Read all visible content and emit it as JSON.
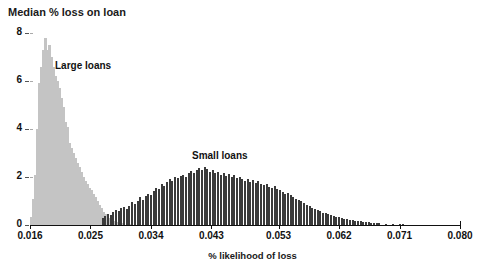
{
  "chart_data": {
    "type": "bar",
    "title": "",
    "ylabel": "Median % loss on loan",
    "xlabel": "% likelihood of loss",
    "ylim": [
      0,
      8
    ],
    "xlim": [
      0.016,
      0.08
    ],
    "grid": false,
    "legend_position": "inline-annotations",
    "y_ticks": [
      0,
      2,
      4,
      6,
      8
    ],
    "y_tick_labels": [
      "0",
      "2",
      "4",
      "6",
      "8"
    ],
    "x_ticks": [
      0.016,
      0.025,
      0.034,
      0.043,
      0.053,
      0.062,
      0.071,
      0.08
    ],
    "x_tick_labels": [
      "0.016",
      "0.025",
      "0.034",
      "0.043",
      "0.053",
      "0.062",
      "0.071",
      "0.080"
    ],
    "annotations": [
      {
        "text": "Large loans",
        "x": 0.0235,
        "y": 6.9
      },
      {
        "text": "Small loans",
        "x": 0.0395,
        "y": 3.1
      }
    ],
    "colors": {
      "large_loans": "#c4c4c4",
      "small_loans": "#3a3a3a",
      "axis": "#111111",
      "text": "#111111",
      "background": "#ffffff"
    },
    "series": [
      {
        "name": "Large loans",
        "color": "#c4c4c4",
        "x": [
          0.0162,
          0.0165,
          0.0168,
          0.0171,
          0.0174,
          0.0177,
          0.018,
          0.0183,
          0.0186,
          0.0189,
          0.0192,
          0.0195,
          0.0198,
          0.0201,
          0.0204,
          0.0207,
          0.021,
          0.0213,
          0.0216,
          0.0219,
          0.0222,
          0.0225,
          0.0228,
          0.0231,
          0.0234,
          0.0237,
          0.024,
          0.0243,
          0.0246,
          0.0249,
          0.0252,
          0.0255,
          0.0258,
          0.0261,
          0.0264,
          0.0267,
          0.027,
          0.0273,
          0.0276,
          0.0279,
          0.0282,
          0.0285,
          0.0288,
          0.0291,
          0.0294,
          0.0297,
          0.03,
          0.0305,
          0.031
        ],
        "values": [
          0.35,
          1.1,
          2.1,
          4.0,
          5.9,
          6.6,
          7.3,
          7.8,
          7.3,
          7.5,
          7.0,
          6.6,
          6.2,
          6.0,
          5.7,
          5.3,
          4.9,
          4.3,
          4.1,
          3.4,
          3.2,
          3.0,
          2.8,
          2.6,
          2.4,
          2.2,
          2.0,
          1.85,
          1.7,
          1.55,
          1.45,
          1.3,
          1.15,
          1.0,
          0.85,
          0.7,
          0.55,
          0.45,
          0.35,
          0.28,
          0.22,
          0.18,
          0.15,
          0.12,
          0.1,
          0.09,
          0.08,
          0.06,
          0.05
        ]
      },
      {
        "name": "Small loans",
        "color": "#3a3a3a",
        "x": [
          0.0268,
          0.0272,
          0.0276,
          0.028,
          0.0284,
          0.0288,
          0.0292,
          0.0296,
          0.03,
          0.0304,
          0.0308,
          0.0312,
          0.0316,
          0.032,
          0.0324,
          0.0328,
          0.0332,
          0.0336,
          0.034,
          0.0344,
          0.0348,
          0.0352,
          0.0356,
          0.036,
          0.0364,
          0.0368,
          0.0372,
          0.0376,
          0.038,
          0.0384,
          0.0388,
          0.0392,
          0.0396,
          0.04,
          0.0404,
          0.0408,
          0.0412,
          0.0416,
          0.042,
          0.0424,
          0.0428,
          0.0432,
          0.0436,
          0.044,
          0.0444,
          0.0448,
          0.0452,
          0.0456,
          0.046,
          0.0464,
          0.0468,
          0.0472,
          0.0476,
          0.048,
          0.0484,
          0.0488,
          0.0492,
          0.0496,
          0.05,
          0.0504,
          0.0508,
          0.0512,
          0.0516,
          0.052,
          0.0524,
          0.0528,
          0.0532,
          0.0536,
          0.054,
          0.0544,
          0.0548,
          0.0552,
          0.0556,
          0.056,
          0.0564,
          0.0568,
          0.0572,
          0.0576,
          0.058,
          0.0584,
          0.0588,
          0.0592,
          0.0596,
          0.06,
          0.0604,
          0.0608,
          0.0612,
          0.0616,
          0.062,
          0.0624,
          0.0628,
          0.0632,
          0.0636,
          0.064,
          0.0644,
          0.0648,
          0.0652,
          0.0656,
          0.066,
          0.0664,
          0.0668,
          0.0672,
          0.0676,
          0.068,
          0.069,
          0.07,
          0.071,
          0.0715
        ],
        "values": [
          0.3,
          0.38,
          0.45,
          0.4,
          0.55,
          0.62,
          0.58,
          0.7,
          0.75,
          0.68,
          0.8,
          0.95,
          0.88,
          1.0,
          1.15,
          1.05,
          1.2,
          1.3,
          1.25,
          1.4,
          1.55,
          1.48,
          1.7,
          1.62,
          1.8,
          1.92,
          1.85,
          2.0,
          1.95,
          2.05,
          2.1,
          2.02,
          2.18,
          2.25,
          2.15,
          2.3,
          2.38,
          2.28,
          2.4,
          2.32,
          2.2,
          2.28,
          2.15,
          2.22,
          2.1,
          2.18,
          2.05,
          2.12,
          2.0,
          2.08,
          1.95,
          2.02,
          1.9,
          1.85,
          1.92,
          1.8,
          1.88,
          1.75,
          1.82,
          1.7,
          1.65,
          1.72,
          1.6,
          1.55,
          1.62,
          1.5,
          1.45,
          1.38,
          1.3,
          1.35,
          1.25,
          1.18,
          1.1,
          1.05,
          0.98,
          0.92,
          0.85,
          0.8,
          0.72,
          0.68,
          0.62,
          0.58,
          0.52,
          0.48,
          0.45,
          0.42,
          0.38,
          0.35,
          0.32,
          0.3,
          0.27,
          0.25,
          0.22,
          0.2,
          0.18,
          0.16,
          0.15,
          0.13,
          0.12,
          0.11,
          0.1,
          0.09,
          0.08,
          0.07,
          0.06,
          0.05,
          0.05,
          0.04
        ]
      }
    ]
  }
}
